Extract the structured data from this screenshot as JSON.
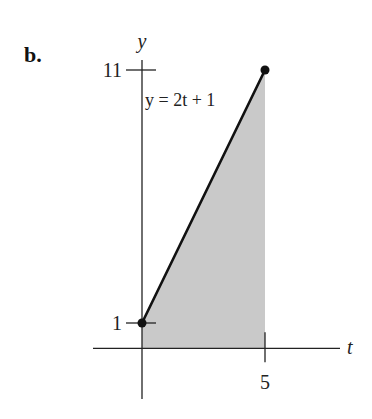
{
  "panel_label": "b.",
  "chart_data": {
    "type": "area",
    "title": "",
    "xlabel": "t",
    "ylabel": "y",
    "xlim": [
      -1.2,
      6.4
    ],
    "ylim": [
      -2,
      13
    ],
    "x_ticks": [
      {
        "value": 5,
        "label": "5"
      }
    ],
    "y_ticks": [
      {
        "value": 1,
        "label": "1"
      },
      {
        "value": 11,
        "label": "11"
      }
    ],
    "series": [
      {
        "name": "y = 2t + 1",
        "x": [
          0,
          5
        ],
        "y": [
          1,
          11
        ],
        "endpoints": "filled-dots",
        "shaded_to_axis": true
      }
    ],
    "annotations": [
      {
        "text": "y = 2t + 1"
      }
    ],
    "grid": false,
    "colors": {
      "line": "#111111",
      "shade": "#c9c9c9",
      "axis": "#222222"
    }
  }
}
